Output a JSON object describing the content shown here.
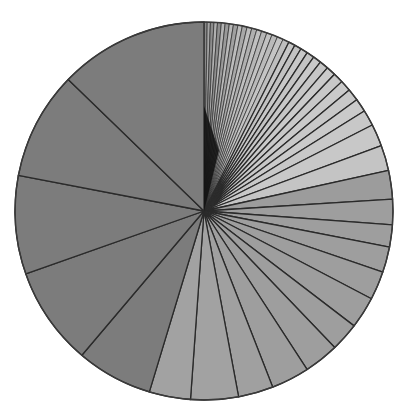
{
  "chart_data": {
    "type": "pie",
    "title": "",
    "legend": [],
    "start_angle_deg": 0,
    "direction": "clockwise",
    "center": [
      204,
      211
    ],
    "radius": 189,
    "note": "Unlabeled pie chart; slices sorted from many thin slices (clockwise from 12 o'clock) to a few large slices. Values are angular shares in degrees estimated from boundary lines.",
    "slices": [
      {
        "value": 1.0,
        "color": "#8a8a8a"
      },
      {
        "value": 1.0,
        "color": "#a6a6a6"
      },
      {
        "value": 1.1,
        "color": "#8c8c8c"
      },
      {
        "value": 1.1,
        "color": "#b0b0b0"
      },
      {
        "value": 1.2,
        "color": "#8e8e8e"
      },
      {
        "value": 1.2,
        "color": "#b4b4b4"
      },
      {
        "value": 1.3,
        "color": "#9a9a9a"
      },
      {
        "value": 1.3,
        "color": "#b8b8b8"
      },
      {
        "value": 1.4,
        "color": "#a0a0a0"
      },
      {
        "value": 1.4,
        "color": "#bcbcbc"
      },
      {
        "value": 1.5,
        "color": "#a8a8a8"
      },
      {
        "value": 1.5,
        "color": "#bebebe"
      },
      {
        "value": 1.6,
        "color": "#b0b0b0"
      },
      {
        "value": 1.6,
        "color": "#c0c0c0"
      },
      {
        "value": 1.7,
        "color": "#b6b6b6"
      },
      {
        "value": 1.7,
        "color": "#c2c2c2"
      },
      {
        "value": 1.8,
        "color": "#bababa"
      },
      {
        "value": 1.9,
        "color": "#c4c4c4"
      },
      {
        "value": 2.0,
        "color": "#bebebe"
      },
      {
        "value": 2.1,
        "color": "#c6c6c6"
      },
      {
        "value": 2.2,
        "color": "#c2c2c2"
      },
      {
        "value": 2.3,
        "color": "#c8c8c8"
      },
      {
        "value": 2.4,
        "color": "#c4c4c4"
      },
      {
        "value": 2.6,
        "color": "#c8c8c8"
      },
      {
        "value": 2.8,
        "color": "#c6c6c6"
      },
      {
        "value": 3.0,
        "color": "#cacaca"
      },
      {
        "value": 3.2,
        "color": "#c8c8c8"
      },
      {
        "value": 3.5,
        "color": "#cacaca"
      },
      {
        "value": 3.8,
        "color": "#c8c8c8"
      },
      {
        "value": 4.2,
        "color": "#cacaca"
      },
      {
        "value": 5.0,
        "color": "#c8c8c8"
      },
      {
        "value": 7.0,
        "color": "#c8c8c8"
      },
      {
        "value": 8.0,
        "color": "#c4c4c4"
      },
      {
        "value": 9.0,
        "color": "#9c9c9c"
      },
      {
        "value": 8.0,
        "color": "#9e9e9e"
      },
      {
        "value": 7.0,
        "color": "#9e9e9e"
      },
      {
        "value": 8.0,
        "color": "#9e9e9e"
      },
      {
        "value": 9.0,
        "color": "#9e9e9e"
      },
      {
        "value": 10.0,
        "color": "#9e9e9e"
      },
      {
        "value": 9.0,
        "color": "#9e9e9e"
      },
      {
        "value": 11.0,
        "color": "#9e9e9e"
      },
      {
        "value": 12.0,
        "color": "#9e9e9e"
      },
      {
        "value": 11.0,
        "color": "#a0a0a0"
      },
      {
        "value": 15.0,
        "color": "#a2a2a2"
      },
      {
        "value": 13.0,
        "color": "#a2a2a2"
      },
      {
        "value": 24.0,
        "color": "#7c7c7c"
      },
      {
        "value": 31.0,
        "color": "#7c7c7c"
      },
      {
        "value": 31.0,
        "color": "#7c7c7c"
      },
      {
        "value": 34.0,
        "color": "#7c7c7c"
      },
      {
        "value": 47.0,
        "color": "#7c7c7c"
      }
    ],
    "stroke_color": "#2a2a2a",
    "center_hub_color": "#111111"
  }
}
